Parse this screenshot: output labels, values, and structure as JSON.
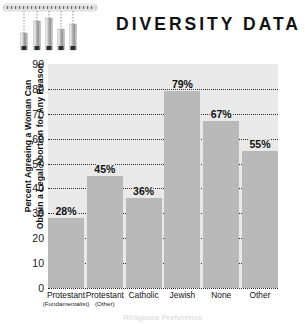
{
  "header": {
    "title": "DIVERSITY DATA",
    "decoration_icon": "slider-gauge-graphic",
    "slider_count": 5
  },
  "chart_data": {
    "type": "bar",
    "title": "DIVERSITY DATA",
    "categories": [
      "Protestant",
      "Protestant",
      "Catholic",
      "Jewish",
      "None",
      "Other"
    ],
    "category_sublabels": [
      "(Fundamentalist)",
      "(Other)",
      "",
      "",
      "",
      ""
    ],
    "values": [
      28,
      45,
      36,
      79,
      67,
      55
    ],
    "value_labels": [
      "28%",
      "45%",
      "36%",
      "79%",
      "67%",
      "55%"
    ],
    "ylabel": "Percent Agreeing a Woman Can Obtain a Legal Abortion for Any Reason",
    "ylabel_line1": "Percent Agreeing a Woman Can",
    "ylabel_line2": "Obtain a Legal Abortion for Any Reason",
    "xlabel": "",
    "ylim": [
      0,
      90
    ],
    "yticks": [
      0,
      10,
      20,
      30,
      40,
      50,
      60,
      70,
      80,
      90
    ],
    "ytick_labels": [
      "0",
      "10",
      "20",
      "30",
      "40",
      "50",
      "60",
      "70",
      "80",
      "90"
    ],
    "grid": true,
    "grid_style": "dotted",
    "legend": false,
    "bar_color": "#b9b9b9",
    "plot_background": "#e9e9e9"
  },
  "caption": {
    "text": "Religious Preference"
  },
  "colors": {
    "title": "#111111",
    "bar": "#b9b9b9",
    "plot_bg": "#e9e9e9",
    "grid": "#2b2b2b",
    "text": "#1a1a1a"
  }
}
